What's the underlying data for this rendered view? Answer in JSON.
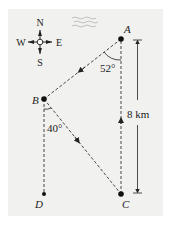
{
  "compass": {
    "north": "N",
    "south": "S",
    "east": "E",
    "west": "W"
  },
  "points": {
    "A": "A",
    "B": "B",
    "C": "C",
    "D": "D"
  },
  "angles": {
    "at_A": "52°",
    "at_B": "40°"
  },
  "distance": {
    "label": "8 km",
    "between": [
      "A",
      "C"
    ]
  },
  "path_segments": [
    {
      "from": "A",
      "to": "B",
      "style": "dashed",
      "arrow": true
    },
    {
      "from": "B",
      "to": "C",
      "style": "dashed",
      "arrow": true
    },
    {
      "from": "C",
      "to": "A",
      "style": "dashed",
      "arrow": true
    },
    {
      "from": "B",
      "to": "D",
      "style": "dashed",
      "arrow": false
    }
  ],
  "colors": {
    "ink": "#222222",
    "panel": "#f1f1f0"
  }
}
